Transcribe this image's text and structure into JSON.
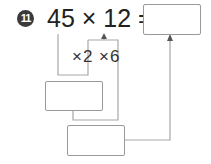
{
  "problem": {
    "number": "11",
    "equation": "45 × 12 =",
    "hints": "×2 ×6"
  },
  "colors": {
    "line": "#9a9a9a",
    "text": "#222222",
    "badge": "#3a3a3a"
  }
}
